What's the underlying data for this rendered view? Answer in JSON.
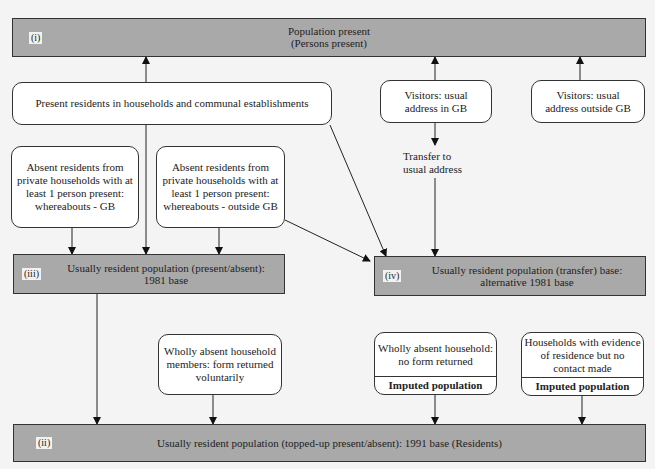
{
  "boxes": {
    "i": {
      "tag": "(i)",
      "line1": "Population present",
      "line2": "(Persons present)"
    },
    "iii": {
      "tag": "(iii)",
      "line1": "Usually resident population (present/absent):",
      "line2": "1981 base"
    },
    "iv": {
      "tag": "(iv)",
      "line1": "Usually resident population (transfer) base:",
      "line2": "alternative 1981 base"
    },
    "ii": {
      "tag": "(ii)",
      "line1": "Usually resident population (topped-up present/absent): 1991 base (Residents)"
    }
  },
  "nodes": {
    "present_residents": "Present residents in households and communal establishments",
    "visitors_gb": "Visitors: usual address in GB",
    "visitors_outside": "Visitors: usual address outside GB",
    "absent_gb": "Absent residents from private households with at least 1 person present: whereabouts - GB",
    "absent_outside": "Absent residents from private households with at least 1 person present: whereabouts - outside GB",
    "transfer": "Transfer to usual address",
    "wholly_absent_voluntary": "Wholly absent household members: form returned voluntarily",
    "wholly_absent_no_form": "Wholly absent household: no form returned",
    "evidence_no_contact": "Households with evidence of residence but no contact made",
    "imputed_label": "Imputed population"
  }
}
